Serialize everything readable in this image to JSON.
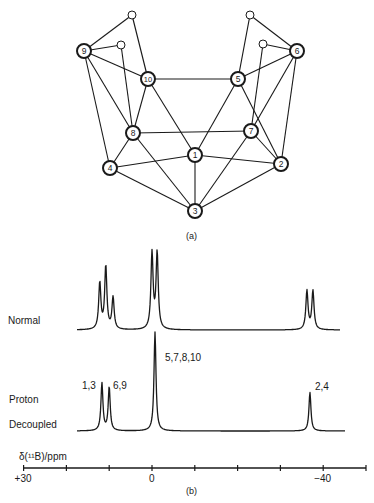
{
  "panel_a": {
    "caption": "(a)",
    "boron_atoms": [
      {
        "id": "1",
        "x": 195,
        "y": 155
      },
      {
        "id": "2",
        "x": 281,
        "y": 164
      },
      {
        "id": "3",
        "x": 195,
        "y": 211
      },
      {
        "id": "4",
        "x": 110,
        "y": 168
      },
      {
        "id": "5",
        "x": 238,
        "y": 79
      },
      {
        "id": "6",
        "x": 297,
        "y": 51
      },
      {
        "id": "7",
        "x": 251,
        "y": 131
      },
      {
        "id": "8",
        "x": 133,
        "y": 133
      },
      {
        "id": "9",
        "x": 84,
        "y": 51
      },
      {
        "id": "10",
        "x": 148,
        "y": 79
      }
    ],
    "bridging_hydrogens": [
      {
        "id": "Ha",
        "x": 132,
        "y": 15
      },
      {
        "id": "Hb",
        "x": 121,
        "y": 45
      },
      {
        "id": "Hc",
        "x": 250,
        "y": 15
      },
      {
        "id": "Hd",
        "x": 263,
        "y": 44
      }
    ],
    "bonds": [
      [
        "9",
        "Ha"
      ],
      [
        "Ha",
        "10"
      ],
      [
        "9",
        "Hb"
      ],
      [
        "Hb",
        "8"
      ],
      [
        "9",
        "10"
      ],
      [
        "9",
        "8"
      ],
      [
        "9",
        "4"
      ],
      [
        "6",
        "Hc"
      ],
      [
        "Hc",
        "5"
      ],
      [
        "6",
        "Hd"
      ],
      [
        "Hd",
        "7"
      ],
      [
        "6",
        "5"
      ],
      [
        "6",
        "7"
      ],
      [
        "6",
        "2"
      ],
      [
        "10",
        "5"
      ],
      [
        "10",
        "8"
      ],
      [
        "10",
        "1"
      ],
      [
        "5",
        "1"
      ],
      [
        "5",
        "2"
      ],
      [
        "8",
        "7"
      ],
      [
        "8",
        "4"
      ],
      [
        "8",
        "3"
      ],
      [
        "7",
        "2"
      ],
      [
        "7",
        "3"
      ],
      [
        "4",
        "1"
      ],
      [
        "1",
        "2"
      ],
      [
        "1",
        "3"
      ],
      [
        "4",
        "3"
      ],
      [
        "2",
        "3"
      ]
    ]
  },
  "panel_b": {
    "caption": "(b)",
    "axis_title": "δ(¹¹B)/ppm",
    "axis_ticks": [
      {
        "ppm": 30,
        "label": "+30"
      },
      {
        "ppm": 20,
        "label": ""
      },
      {
        "ppm": 10,
        "label": ""
      },
      {
        "ppm": 0,
        "label": "0"
      },
      {
        "ppm": -10,
        "label": ""
      },
      {
        "ppm": -20,
        "label": ""
      },
      {
        "ppm": -30,
        "label": ""
      },
      {
        "ppm": -40,
        "label": "−40"
      },
      {
        "ppm": -50,
        "label": ""
      }
    ],
    "trace_labels": {
      "normal": "Normal",
      "decoupled_line1": "Proton",
      "decoupled_line2": "Decoupled"
    },
    "peak_labels": [
      {
        "text": "1,3",
        "x": 82,
        "y": 391
      },
      {
        "text": "6,9",
        "x": 113,
        "y": 391
      },
      {
        "text": "5,7,8,10",
        "x": 165,
        "y": 363
      },
      {
        "text": "2,4",
        "x": 315,
        "y": 392
      }
    ]
  },
  "chart_data": {
    "type": "line",
    "xlabel": "δ(11B)/ppm",
    "ylabel": "",
    "xlim": [
      30,
      -50
    ],
    "x_ticks": [
      30,
      20,
      10,
      0,
      -10,
      -20,
      -30,
      -40,
      -50
    ],
    "x_tick_labels": [
      "+30",
      "",
      "",
      "0",
      "",
      "",
      "",
      "-40",
      ""
    ],
    "grid": false,
    "series": [
      {
        "name": "Normal",
        "peaks": [
          {
            "ppm": 12.2,
            "rel_height": 0.61
          },
          {
            "ppm": 10.8,
            "rel_height": 0.83
          },
          {
            "ppm": 9.1,
            "rel_height": 0.42
          },
          {
            "ppm": 0.0,
            "rel_height": 1.0
          },
          {
            "ppm": -1.2,
            "rel_height": 1.0
          },
          {
            "ppm": -36.2,
            "rel_height": 0.51
          },
          {
            "ppm": -37.6,
            "rel_height": 0.51
          }
        ]
      },
      {
        "name": "Proton Decoupled",
        "peaks": [
          {
            "ppm": 11.7,
            "rel_height": 0.48,
            "label": "1,3"
          },
          {
            "ppm": 10.0,
            "rel_height": 0.44,
            "label": "6,9"
          },
          {
            "ppm": -0.7,
            "rel_height": 1.0,
            "label": "5,7,8,10"
          },
          {
            "ppm": -36.9,
            "rel_height": 0.39,
            "label": "2,4"
          }
        ]
      }
    ]
  }
}
